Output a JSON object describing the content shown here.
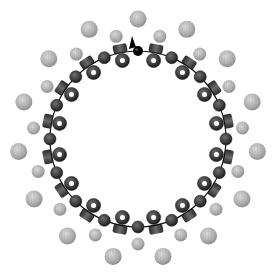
{
  "diagram": {
    "canvas": {
      "width": 278,
      "height": 280,
      "background": "#ffffff"
    },
    "center": {
      "x": 138,
      "y": 139
    },
    "backbone": {
      "radius": 88,
      "stroke": "#111111",
      "stroke_width": 1.2
    },
    "inner_ring": {
      "unit_count": 32,
      "start_angle_deg": 90,
      "step_deg": 11.25,
      "dark_sphere": {
        "diameter": 12,
        "color": "#3f3f3f",
        "rim": "#1e1e1e",
        "highlight": "#6a6a6a"
      },
      "d_bead": {
        "ring_radius": 80,
        "stem_radius": 92,
        "ring_diameter": 14,
        "hole_diameter": 5,
        "stem_width": 14,
        "stem_height": 9,
        "color": "#3a3a3a",
        "stem_color": "#555555"
      },
      "marker": {
        "index": 0,
        "sphere_color": "#000000",
        "arrow_color": "#000000"
      }
    },
    "light_spheres_inner": {
      "count": 15,
      "radius": 105,
      "start_angle_deg": 102,
      "step_deg": 24,
      "diameter": 13,
      "color": "#b4b4b4",
      "highlight": "#d8d8d8"
    },
    "light_spheres_outer": {
      "count": 15,
      "radius": 120,
      "start_angle_deg": 90,
      "step_deg": 24,
      "diameter": 17,
      "color": "#a9a9a9",
      "highlight": "#d2d2d2"
    }
  }
}
